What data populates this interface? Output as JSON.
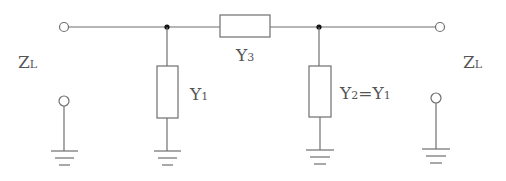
{
  "diagram": {
    "type": "circuit",
    "labels": {
      "left_load": {
        "main": "Z",
        "sub": "L"
      },
      "right_load": {
        "main": "Z",
        "sub": "L"
      },
      "series": {
        "main": "Y",
        "sub": "3"
      },
      "shunt_left": {
        "main": "Y",
        "sub": "1"
      },
      "shunt_right": {
        "main": "Y",
        "sub": "2",
        "suffix": "=Y",
        "suffix_sub": "1"
      }
    },
    "colors": {
      "line": "#6f6f6f",
      "junction": "#111111",
      "text": "#555555",
      "background": "#ffffff"
    }
  }
}
